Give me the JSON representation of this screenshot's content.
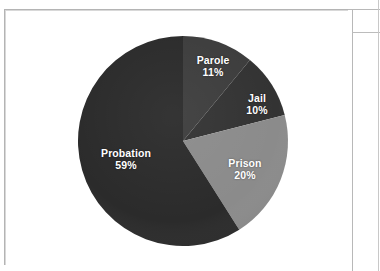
{
  "document": {
    "background_color": "#ffffff",
    "frame_color": "#b4b4b4"
  },
  "chart_data": {
    "type": "pie",
    "title": "",
    "subtitle": "",
    "xlabel": "",
    "ylabel": "",
    "legend_position": "none",
    "grid": false,
    "labels_inside_slices": true,
    "value_unit": "%",
    "start_angle_deg": 0,
    "direction": "clockwise",
    "categories": [
      "Parole",
      "Jail",
      "Prison",
      "Probation"
    ],
    "values": [
      11,
      10,
      20,
      59
    ],
    "slices": [
      {
        "name": "Parole",
        "label": "Parole",
        "value": 11,
        "value_label": "11%",
        "color": "#3d3d3d",
        "start_deg": 0,
        "end_deg": 39.6
      },
      {
        "name": "Jail",
        "label": "Jail",
        "value": 10,
        "value_label": "10%",
        "color": "#333333",
        "start_deg": 39.6,
        "end_deg": 75.6
      },
      {
        "name": "Prison",
        "label": "Prison",
        "value": 20,
        "value_label": "20%",
        "color": "#8b8b8b",
        "start_deg": 75.6,
        "end_deg": 147.6
      },
      {
        "name": "Probation",
        "label": "Probation",
        "value": 59,
        "value_label": "59%",
        "color": "#2b2b2b",
        "start_deg": 147.6,
        "end_deg": 360
      }
    ],
    "geometry": {
      "center_x": 178,
      "center_y": 131,
      "radius": 105
    },
    "label_color": "#ffffff"
  }
}
